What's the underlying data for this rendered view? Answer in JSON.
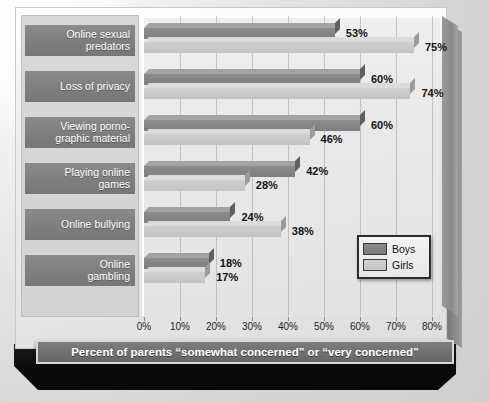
{
  "chart_data": {
    "type": "bar",
    "orientation": "horizontal",
    "grouped": true,
    "title": "",
    "subtitle": "",
    "caption": "Percent of parents “somewhat concerned” or “very concerned”",
    "xlabel": "",
    "ylabel": "",
    "xlim": [
      0,
      80
    ],
    "xtick_step": 10,
    "xticks": [
      "0%",
      "10%",
      "20%",
      "30%",
      "40%",
      "50%",
      "60%",
      "70%",
      "80%"
    ],
    "grid": true,
    "legend_position": "inside-bottom-right",
    "categories": [
      "Online sexual predators",
      "Loss of privacy",
      "Viewing pornographic material",
      "Playing online games",
      "Online bullying",
      "Online gambling"
    ],
    "category_display": [
      "Online sexual\npredators",
      "Loss of privacy",
      "Viewing porno-\ngraphic material",
      "Playing online\ngames",
      "Online bullying",
      "Online\ngambling"
    ],
    "series": [
      {
        "name": "Boys",
        "color": "#7f7f7f",
        "values": [
          53,
          60,
          60,
          42,
          24,
          18
        ],
        "labels": [
          "53%",
          "60%",
          "60%",
          "42%",
          "24%",
          "18%"
        ]
      },
      {
        "name": "Girls",
        "color": "#c8c8c8",
        "values": [
          75,
          74,
          46,
          28,
          38,
          17
        ],
        "labels": [
          "75%",
          "74%",
          "46%",
          "28%",
          "38%",
          "17%"
        ]
      }
    ]
  },
  "legend": {
    "entries": [
      {
        "label": "Boys",
        "swatch": "boys-swatch"
      },
      {
        "label": "Girls",
        "swatch": "girls-swatch"
      }
    ]
  },
  "colors": {
    "boys": "#7f7f7f",
    "girls": "#c8c8c8",
    "board": "#e9e9e9",
    "label_band": "#7f7f7f",
    "caption_bar": "#6f6f6f",
    "base_slab": "#0b0b0b"
  }
}
